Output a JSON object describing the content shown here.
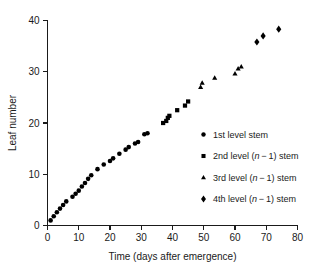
{
  "chart_data": {
    "type": "scatter",
    "title": "",
    "xlabel": "Time (days after emergence)",
    "ylabel": "Leaf number",
    "xlim": [
      0,
      80
    ],
    "ylim": [
      0,
      40
    ],
    "xticks": [
      0,
      10,
      20,
      30,
      40,
      50,
      60,
      70,
      80
    ],
    "yticks": [
      0,
      10,
      20,
      30,
      40
    ],
    "grid": false,
    "legend_position": "right",
    "marker_color": "#000000",
    "series": [
      {
        "name": "1st level stem",
        "marker": "circle",
        "x": [
          1,
          2,
          3,
          4,
          5,
          6,
          8,
          9,
          10,
          11,
          12,
          13,
          14,
          16,
          18,
          20,
          21,
          23,
          25,
          26,
          28,
          29,
          31,
          32
        ],
        "y": [
          1.0,
          1.8,
          2.6,
          3.3,
          4.0,
          4.7,
          5.6,
          6.2,
          6.8,
          7.6,
          8.3,
          9.1,
          9.8,
          11.0,
          11.9,
          12.6,
          13.1,
          14.0,
          14.8,
          15.3,
          16.0,
          16.3,
          17.8,
          18.0
        ]
      },
      {
        "name": "2nd level (n − 1) stem",
        "marker": "square",
        "x": [
          37,
          38,
          38.5,
          39,
          41.5,
          44,
          45
        ],
        "y": [
          20.0,
          20.4,
          21.0,
          21.4,
          22.5,
          23.4,
          24.2
        ]
      },
      {
        "name": "3rd level (n − 1) stem",
        "marker": "triangle",
        "x": [
          49,
          49.5,
          53.5,
          60,
          61,
          62
        ],
        "y": [
          27.0,
          27.8,
          28.8,
          29.6,
          30.6,
          31.0
        ]
      },
      {
        "name": "4th level (n − 1) stem",
        "marker": "diamond",
        "x": [
          67,
          69,
          74
        ],
        "y": [
          35.8,
          37.0,
          38.3
        ]
      }
    ]
  },
  "legend": {
    "entries": [
      {
        "marker": "circle",
        "label_prefix": "1st level stem",
        "has_italic": false,
        "label_pre": "1st level stem",
        "italic": "",
        "label_post": ""
      },
      {
        "marker": "square",
        "label_prefix": "2nd level (",
        "has_italic": true,
        "label_pre": "2nd level (",
        "italic": "n",
        "label_post": " − 1) stem"
      },
      {
        "marker": "triangle",
        "label_prefix": "3rd level (",
        "has_italic": true,
        "label_pre": "3rd level (",
        "italic": "n",
        "label_post": " − 1) stem"
      },
      {
        "marker": "diamond",
        "label_prefix": "4th level (",
        "has_italic": true,
        "label_pre": "4th level (",
        "italic": "n",
        "label_post": " − 1) stem"
      }
    ]
  },
  "axes": {
    "x_label_text": "Time (days after emergence)",
    "y_label_text": "Leaf number",
    "x_tick_labels": [
      "0",
      "10",
      "20",
      "30",
      "40",
      "50",
      "60",
      "70",
      "80"
    ],
    "y_tick_labels": [
      "0",
      "10",
      "20",
      "30",
      "40"
    ]
  }
}
